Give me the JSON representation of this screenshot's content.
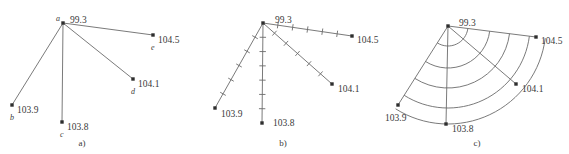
{
  "figure": {
    "title_ghost": "",
    "width": 569,
    "height": 154,
    "background": "#ffffff",
    "line_color": "#6b6b6b",
    "node_color": "#2e2e2e",
    "text_color": "#3a3a3a"
  },
  "panels": [
    {
      "id": "a",
      "caption": "a)",
      "caption_pos": {
        "x": 82,
        "y": 146
      },
      "description": "star graph with straight edges from centre node a to nodes b, c, d, e",
      "nodes": [
        {
          "key": "a",
          "label": "a",
          "value": "99.3",
          "x": 63,
          "y": 23,
          "value_pos": {
            "x": 70,
            "y": 19
          },
          "label_pos": {
            "x": 56,
            "y": 18
          }
        },
        {
          "key": "b",
          "label": "b",
          "value": "103.9",
          "x": 12,
          "y": 105,
          "value_pos": {
            "x": 17,
            "y": 109
          },
          "label_pos": {
            "x": 10,
            "y": 117
          }
        },
        {
          "key": "c",
          "label": "c",
          "value": "103.8",
          "x": 62,
          "y": 122,
          "value_pos": {
            "x": 67,
            "y": 126
          },
          "label_pos": {
            "x": 60,
            "y": 134
          }
        },
        {
          "key": "d",
          "label": "d",
          "value": "104.1",
          "x": 133,
          "y": 79,
          "value_pos": {
            "x": 138,
            "y": 83
          },
          "label_pos": {
            "x": 131,
            "y": 91
          }
        },
        {
          "key": "e",
          "label": "e",
          "value": "104.5",
          "x": 153,
          "y": 35,
          "value_pos": {
            "x": 158,
            "y": 39
          },
          "label_pos": {
            "x": 151,
            "y": 47
          }
        }
      ],
      "edges": [
        {
          "from": "a",
          "to": "b"
        },
        {
          "from": "a",
          "to": "c"
        },
        {
          "from": "a",
          "to": "d"
        },
        {
          "from": "a",
          "to": "e"
        }
      ]
    },
    {
      "id": "b",
      "caption": "b)",
      "caption_pos": {
        "x": 283,
        "y": 146
      },
      "description": "same star graph with tick marks spaced along each edge",
      "nodes": [
        {
          "key": "a",
          "label": "",
          "value": "99.3",
          "x": 263,
          "y": 23,
          "value_pos": {
            "x": 275,
            "y": 19
          }
        },
        {
          "key": "b",
          "label": "",
          "value": "103.9",
          "x": 215,
          "y": 108,
          "value_pos": {
            "x": 221,
            "y": 113
          }
        },
        {
          "key": "c",
          "label": "",
          "value": "103.8",
          "x": 262,
          "y": 123,
          "value_pos": {
            "x": 273,
            "y": 122
          }
        },
        {
          "key": "d",
          "label": "",
          "value": "104.1",
          "x": 332,
          "y": 84,
          "value_pos": {
            "x": 338,
            "y": 88
          }
        },
        {
          "key": "e",
          "label": "",
          "value": "104.5",
          "x": 352,
          "y": 36,
          "value_pos": {
            "x": 357,
            "y": 39
          }
        }
      ],
      "edges": [
        {
          "from": "a",
          "to": "b",
          "ticks": 5
        },
        {
          "from": "a",
          "to": "c",
          "ticks": 6
        },
        {
          "from": "a",
          "to": "d",
          "ticks": 5
        },
        {
          "from": "a",
          "to": "e",
          "ticks": 5
        }
      ]
    },
    {
      "id": "c",
      "caption": "c)",
      "caption_pos": {
        "x": 477,
        "y": 146
      },
      "description": "same star graph with concentric circular arcs centred on node a joining equal-distance tick positions",
      "nodes": [
        {
          "key": "a",
          "label": "",
          "value": "99.3",
          "x": 448,
          "y": 26,
          "value_pos": {
            "x": 459,
            "y": 22
          }
        },
        {
          "key": "b",
          "label": "",
          "value": "103.9",
          "x": 398,
          "y": 105,
          "value_pos": {
            "x": 385,
            "y": 117
          }
        },
        {
          "key": "c",
          "label": "",
          "value": "103.8",
          "x": 446,
          "y": 124,
          "value_pos": {
            "x": 452,
            "y": 128
          }
        },
        {
          "key": "d",
          "label": "",
          "value": "104.1",
          "x": 516,
          "y": 84,
          "value_pos": {
            "x": 522,
            "y": 88
          }
        },
        {
          "key": "e",
          "label": "",
          "value": "104.5",
          "x": 536,
          "y": 37,
          "value_pos": {
            "x": 541,
            "y": 40
          }
        }
      ],
      "edges": [
        {
          "from": "a",
          "to": "b"
        },
        {
          "from": "a",
          "to": "c"
        },
        {
          "from": "a",
          "to": "d"
        },
        {
          "from": "a",
          "to": "e"
        }
      ],
      "arc_radii": [
        20,
        42,
        62,
        82,
        98
      ]
    }
  ]
}
